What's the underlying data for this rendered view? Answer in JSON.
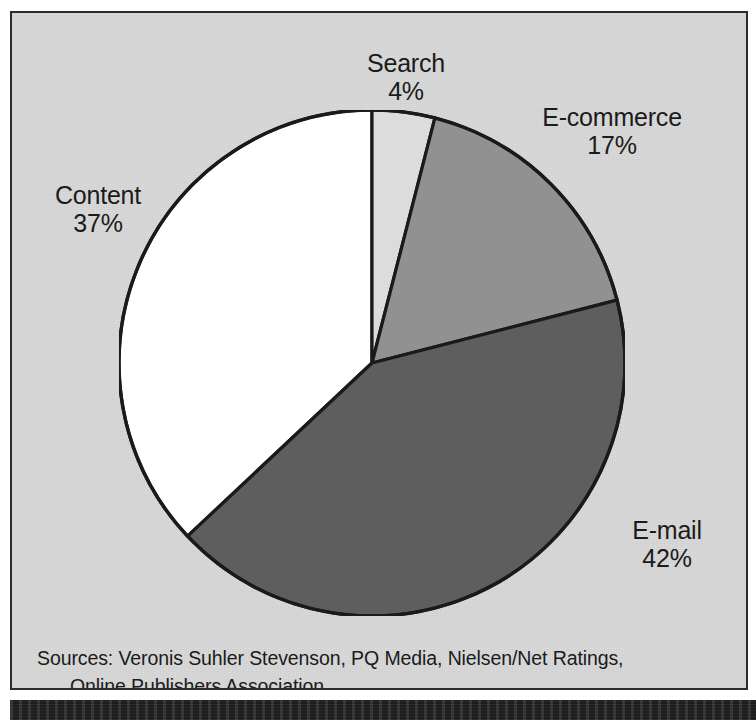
{
  "figure": {
    "title_fragment": "Internet Advertising Spending by Format",
    "background_color": "#d9d9d9",
    "frame_color": "#2b2b2b"
  },
  "chart_data": {
    "type": "pie",
    "title": "",
    "xlabel": "",
    "ylabel": "",
    "categories": [
      "Search",
      "E-commerce",
      "E-mail",
      "Content"
    ],
    "values": [
      4,
      17,
      42,
      37
    ],
    "unit": "percent",
    "start_angle_deg": 0,
    "direction": "clockwise",
    "legend_position": "none",
    "grid": false,
    "slices": [
      {
        "name": "Search",
        "label": "Search",
        "percent": 4,
        "percent_label": "4%",
        "color": "#dcdcdc",
        "start_deg": 0,
        "end_deg": 14.4,
        "label_position": "top"
      },
      {
        "name": "E-commerce",
        "label": "E-commerce",
        "percent": 17,
        "percent_label": "17%",
        "color": "#919191",
        "start_deg": 14.4,
        "end_deg": 75.6,
        "label_position": "top-right"
      },
      {
        "name": "E-mail",
        "label": "E-mail",
        "percent": 42,
        "percent_label": "42%",
        "color": "#5e5e5e",
        "start_deg": 75.6,
        "end_deg": 226.8,
        "label_position": "bottom-right"
      },
      {
        "name": "Content",
        "label": "Content",
        "percent": 37,
        "percent_label": "37%",
        "color": "#ffffff",
        "start_deg": 226.8,
        "end_deg": 360,
        "label_position": "left"
      }
    ],
    "annotations": [
      "Sources: Veronis Suhler Stevenson, PQ Media, Nielsen/Net Ratings,",
      "Online Publishers Association"
    ]
  },
  "labels": {
    "search": {
      "name": "Search",
      "percent": "4%"
    },
    "ecommerce": {
      "name": "E-commerce",
      "percent": "17%"
    },
    "content": {
      "name": "Content",
      "percent": "37%"
    },
    "email": {
      "name": "E-mail",
      "percent": "42%"
    }
  },
  "sources": {
    "line1": "Sources: Veronis Suhler Stevenson, PQ Media, Nielsen/Net Ratings,",
    "line2": "Online Publishers Association"
  }
}
